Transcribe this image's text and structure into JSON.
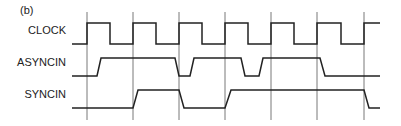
{
  "figure": {
    "panel_label": "(b)",
    "signals": [
      {
        "name": "CLOCK",
        "label_y": 34,
        "points": [
          [
            72,
            44
          ],
          [
            87,
            44
          ],
          [
            87,
            23
          ],
          [
            110,
            23
          ],
          [
            110,
            44
          ],
          [
            133,
            44
          ],
          [
            133,
            23
          ],
          [
            156,
            23
          ],
          [
            156,
            44
          ],
          [
            179,
            44
          ],
          [
            179,
            23
          ],
          [
            202,
            23
          ],
          [
            202,
            44
          ],
          [
            225,
            44
          ],
          [
            225,
            23
          ],
          [
            248,
            23
          ],
          [
            248,
            44
          ],
          [
            271,
            44
          ],
          [
            271,
            23
          ],
          [
            294,
            23
          ],
          [
            294,
            44
          ],
          [
            317,
            44
          ],
          [
            317,
            23
          ],
          [
            341,
            23
          ],
          [
            341,
            44
          ],
          [
            364,
            44
          ],
          [
            364,
            23
          ],
          [
            380,
            23
          ]
        ]
      },
      {
        "name": "ASYNCIN",
        "label_y": 66,
        "points": [
          [
            72,
            76
          ],
          [
            97,
            76
          ],
          [
            101,
            58
          ],
          [
            175,
            58
          ],
          [
            179,
            76
          ],
          [
            190,
            76
          ],
          [
            194,
            58
          ],
          [
            241,
            58
          ],
          [
            245,
            76
          ],
          [
            259,
            76
          ],
          [
            263,
            58
          ],
          [
            320,
            58
          ],
          [
            325,
            76
          ],
          [
            380,
            76
          ]
        ]
      },
      {
        "name": "SYNCIN",
        "label_y": 98,
        "points": [
          [
            72,
            108
          ],
          [
            133,
            108
          ],
          [
            138,
            90
          ],
          [
            179,
            90
          ],
          [
            184,
            108
          ],
          [
            225,
            108
          ],
          [
            231,
            90
          ],
          [
            364,
            90
          ],
          [
            369,
            108
          ],
          [
            380,
            108
          ]
        ]
      }
    ],
    "gridlines_x": [
      87,
      133,
      179,
      225,
      271,
      317,
      364
    ],
    "grid_y_range": [
      12,
      120
    ],
    "colors": {
      "line": "#222222",
      "grid": "#555555",
      "background": "#ffffff"
    }
  }
}
